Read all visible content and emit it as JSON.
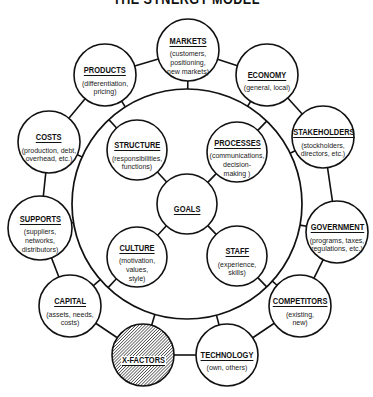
{
  "title": "THE SYNERGY MODEL",
  "colors": {
    "ink": "#111111",
    "background": "#ffffff",
    "hatch": "#333333"
  },
  "center": {
    "id": "goals",
    "label": "GOALS"
  },
  "inner": [
    {
      "id": "structure",
      "label": "STRUCTURE",
      "sub": "(responsibilities,\nfunctions)"
    },
    {
      "id": "processes",
      "label": "PROCESSES",
      "sub": "(communications,\ndecision-\nmaking )"
    },
    {
      "id": "culture",
      "label": "CULTURE",
      "sub": "(motivation,\nvalues,\nstyle)"
    },
    {
      "id": "staff",
      "label": "STAFF",
      "sub": "(experience,\nskills)"
    }
  ],
  "outer": [
    {
      "id": "markets",
      "label": "MARKETS",
      "sub": "(customers,\npositioning,\nnew markets)"
    },
    {
      "id": "economy",
      "label": "ECONOMY",
      "sub": "(general, local)"
    },
    {
      "id": "stakeholders",
      "label": "STAKEHOLDERS",
      "sub": "(stockholders,\ndirectors, etc.)"
    },
    {
      "id": "government",
      "label": "GOVERNMENT",
      "sub": "(programs, taxes,\nregulations, etc.)"
    },
    {
      "id": "competitors",
      "label": "COMPETITORS",
      "sub": "(existing,\nnew)"
    },
    {
      "id": "technology",
      "label": "TECHNOLOGY",
      "sub": "(own, others)"
    },
    {
      "id": "x-factors",
      "label": "X-FACTORS",
      "sub": ""
    },
    {
      "id": "capital",
      "label": "CAPITAL",
      "sub": "(assets, needs,\ncosts)"
    },
    {
      "id": "supports",
      "label": "SUPPORTS",
      "sub": "(suppliers,\nnetworks,\ndistributors)"
    },
    {
      "id": "costs",
      "label": "COSTS",
      "sub": "(production, debt,\noverhead, etc.)"
    },
    {
      "id": "products",
      "label": "PRODUCTS",
      "sub": "(differentiation,\npricing)"
    }
  ]
}
